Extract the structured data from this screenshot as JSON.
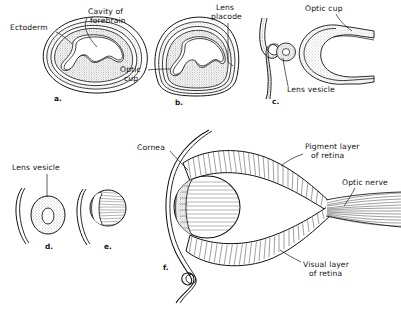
{
  "figure": {
    "background_color": "#ffffff",
    "ink_color": "#111111",
    "stipple_color": "#b9b9b9",
    "panels": [
      {
        "id": "a",
        "letter": "a.",
        "caption": "Early forebrain vesicle with surface ectoderm",
        "labels": [
          "Ectoderm",
          "Cavity of forebrain"
        ]
      },
      {
        "id": "b",
        "letter": "b.",
        "caption": "Optic cup forming, lens placode thickening",
        "labels": [
          "Optic cup",
          "Lens placode"
        ]
      },
      {
        "id": "c",
        "letter": "c.",
        "caption": "Optic cup invaginated, lens vesicle pinching off",
        "labels": [
          "Optic cup",
          "Lens vesicle"
        ]
      },
      {
        "id": "d",
        "letter": "d.",
        "caption": "Detached lens vesicle, hollow",
        "labels": [
          "Lens vesicle"
        ]
      },
      {
        "id": "e",
        "letter": "e.",
        "caption": "Lens vesicle filling with lens fibers",
        "labels": []
      },
      {
        "id": "f",
        "letter": "f.",
        "caption": "Mature eye with cornea, lens, two-layered retina and optic nerve",
        "labels": [
          "Cornea",
          "Pigment layer of retina",
          "Optic nerve",
          "Visual layer of retina"
        ]
      }
    ],
    "annotations": [
      {
        "key": "ectoderm",
        "line1": "Ectoderm",
        "line2": "",
        "panel": "a"
      },
      {
        "key": "cavity",
        "line1": "Cavity  of",
        "line2": "forebrain",
        "panel": "a"
      },
      {
        "key": "optic_cup_b",
        "line1": "Optic",
        "line2": "cup",
        "panel": "b"
      },
      {
        "key": "lens_placode",
        "line1": "Lens",
        "line2": "placode",
        "panel": "b"
      },
      {
        "key": "optic_cup_c",
        "line1": "Optic cup",
        "line2": "",
        "panel": "c"
      },
      {
        "key": "lens_vesicle_c",
        "line1": "Lens  vesicle",
        "line2": "",
        "panel": "c"
      },
      {
        "key": "lens_vesicle_d",
        "line1": "Lens  vesicle",
        "line2": "",
        "panel": "d"
      },
      {
        "key": "cornea",
        "line1": "Cornea",
        "line2": "",
        "panel": "f"
      },
      {
        "key": "pigment_layer",
        "line1": "Pigment layer",
        "line2": "of retina",
        "panel": "f"
      },
      {
        "key": "optic_nerve",
        "line1": "Optic nerve",
        "line2": "",
        "panel": "f"
      },
      {
        "key": "visual_layer",
        "line1": "Visual layer",
        "line2": "of retina",
        "panel": "f"
      }
    ],
    "panel_letters": {
      "a": "a.",
      "b": "b.",
      "c": "c.",
      "d": "d.",
      "e": "e.",
      "f": "f."
    }
  }
}
